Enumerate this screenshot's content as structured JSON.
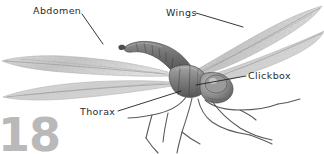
{
  "figure": {
    "background_color": "#ffffff",
    "ink_color": "#2b2b2b",
    "body_gray": "#8a8a8a",
    "wing_gray": "#c9c9c9",
    "page_number": "18",
    "page_number_color": "#b9b9b9"
  },
  "labels": {
    "abdomen": "Abdomen",
    "wings": "Wings",
    "clickbox": "Clickbox",
    "thorax": "Thorax"
  },
  "leader_lines": [
    {
      "name": "abdomen-leader",
      "from": [
        82,
        14
      ],
      "to": [
        103,
        44
      ]
    },
    {
      "name": "wings-leader",
      "from": [
        196,
        13
      ],
      "to": [
        242,
        27
      ]
    },
    {
      "name": "clickbox-leader",
      "from": [
        246,
        76
      ],
      "to": [
        196,
        84
      ]
    },
    {
      "name": "thorax-leader",
      "from": [
        117,
        111
      ],
      "to": [
        181,
        91
      ]
    }
  ]
}
